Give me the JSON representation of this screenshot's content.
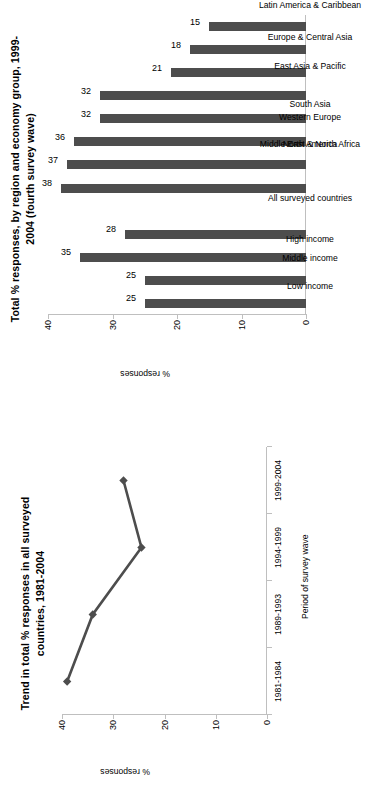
{
  "figure": {
    "background": "#ffffff",
    "series_color": "#4d4d4d",
    "axis_color": "#bfbfbf"
  },
  "bar_chart_panel": {
    "title": "Total % responses, by region and economy group, 1999-2004 (fourth survey wave)",
    "value_axis_name": "% responses"
  },
  "line_chart_panel": {
    "title": "Trend in total % responses in all surveyed countries, 1981-2004",
    "value_axis_name": "% responses",
    "category_axis_name": "Period of survey wave"
  },
  "chart_data": [
    {
      "type": "bar",
      "title": "Total % responses, by region and economy group, 1999-2004 (fourth survey wave)",
      "xlabel": "",
      "ylabel": "% responses",
      "ylim": [
        0,
        40
      ],
      "yticks": [
        0,
        10,
        20,
        30,
        40
      ],
      "grid": false,
      "legend": "none",
      "orientation": "vertical",
      "bar_color": "#4d4d4d",
      "data_labels": true,
      "categories": [
        "Low income",
        "Middle income",
        "High income",
        "All surveyed countries",
        "",
        "Middle East & North Africa",
        "North America",
        "Western Europe",
        "South Asia",
        "East Asia & Pacific",
        "Europe & Central Asia",
        "Latin America & Caribbean",
        "Sub-Saharan Africa"
      ],
      "values": [
        25,
        25,
        35,
        28,
        null,
        38,
        37,
        36,
        32,
        32,
        21,
        18,
        15
      ]
    },
    {
      "type": "line",
      "title": "Trend in total % responses in all surveyed countries, 1981-2004",
      "xlabel": "Period of survey wave",
      "ylabel": "% responses",
      "ylim": [
        0,
        40
      ],
      "yticks": [
        0,
        10,
        20,
        30,
        40
      ],
      "grid": false,
      "legend": "none",
      "line_color": "#4d4d4d",
      "marker": "diamond",
      "categories": [
        "1981-1984",
        "1989-1993",
        "1994-1999",
        "1999-2004"
      ],
      "values": [
        39,
        34,
        24.5,
        28
      ]
    }
  ]
}
